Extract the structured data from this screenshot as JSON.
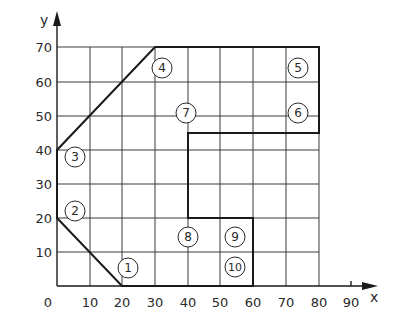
{
  "diagram": {
    "type": "coordinate-outline",
    "axes": {
      "x": {
        "label": "x",
        "ticks": [
          "0",
          "10",
          "20",
          "30",
          "40",
          "50",
          "60",
          "70",
          "80",
          "90"
        ]
      },
      "y": {
        "label": "y",
        "ticks": [
          "10",
          "20",
          "30",
          "40",
          "50",
          "60",
          "70"
        ]
      }
    },
    "outline_points": [
      [
        0,
        20
      ],
      [
        20,
        0
      ],
      [
        60,
        0
      ],
      [
        60,
        20
      ],
      [
        40,
        20
      ],
      [
        40,
        45
      ],
      [
        80,
        45
      ],
      [
        80,
        70
      ],
      [
        30,
        70
      ],
      [
        0,
        40
      ]
    ],
    "point_labels": [
      {
        "id": "1",
        "x": 20,
        "y": 0
      },
      {
        "id": "2",
        "x": 0,
        "y": 20
      },
      {
        "id": "3",
        "x": 0,
        "y": 40
      },
      {
        "id": "4",
        "x": 30,
        "y": 70
      },
      {
        "id": "5",
        "x": 80,
        "y": 70
      },
      {
        "id": "6",
        "x": 80,
        "y": 45
      },
      {
        "id": "7",
        "x": 40,
        "y": 45
      },
      {
        "id": "8",
        "x": 40,
        "y": 20
      },
      {
        "id": "9",
        "x": 60,
        "y": 20
      },
      {
        "id": "10",
        "x": 60,
        "y": 0
      }
    ],
    "colors": {
      "line": "#1a1a1a",
      "grid": "#3a3a3a",
      "background": "#ffffff"
    }
  }
}
